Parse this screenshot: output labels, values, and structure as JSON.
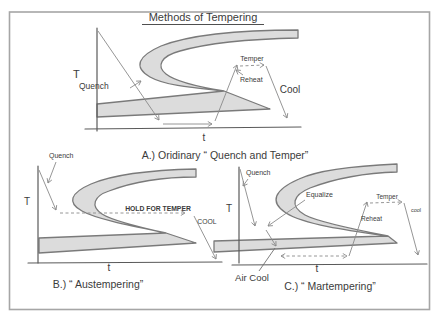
{
  "title": "Methods of Tempering",
  "colors": {
    "band_fill": "#dcdcdc",
    "band_stroke": "#7a7a7a",
    "flow_line": "#8a8a8a",
    "axis": "#5a5a5a",
    "text": "#3b3b3b",
    "border": "#a6a6a6"
  },
  "diagram_a": {
    "caption": "A.)  Oridinary “ Quench and Temper”",
    "temp_axis": "T",
    "time_axis": "t",
    "quench": "Quench",
    "temper": "Temper",
    "reheat": "Reheat",
    "cool": "Cool"
  },
  "diagram_b": {
    "caption": "B.) “ Austempering”",
    "temp_axis": "T",
    "time_axis": "t",
    "quench": "Quench",
    "hold": "HOLD FOR TEMPER",
    "cool": "COOL"
  },
  "diagram_c": {
    "caption": "C.) “ Martempering”",
    "temp_axis": "T",
    "time_axis": "t",
    "quench": "Quench",
    "equalize": "Equalize",
    "air_cool": "Air Cool",
    "reheat": "Reheat",
    "temper": "Temper",
    "cool": "cool"
  }
}
